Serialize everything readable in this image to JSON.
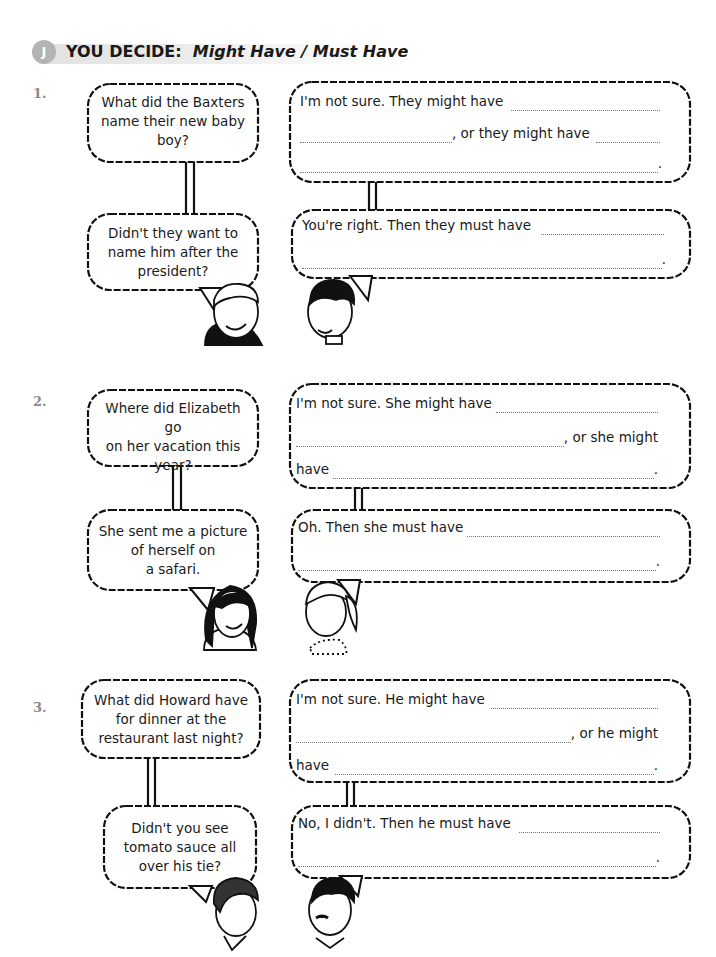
{
  "header": {
    "badge": "J",
    "title_prefix": "YOU DECIDE:",
    "title_italic": "Might Have / Must Have"
  },
  "exercises": [
    {
      "number": "1.",
      "question": "What did the Baxters name their new baby boy?",
      "q_lines": [
        "What did the Baxters",
        "name their new baby",
        "boy?"
      ],
      "followup_lines": [
        "Didn't they want to",
        "name him after the",
        "president?"
      ],
      "answer1": {
        "line1_prefix": "I'm not sure.  They might have",
        "line2_suffix": ", or they might have",
        "line3_suffix": "."
      },
      "answer2": {
        "line1_prefix": "You're right.  Then they must have",
        "line2_suffix": "."
      }
    },
    {
      "number": "2.",
      "q_lines": [
        "Where did Elizabeth go",
        "on her vacation this",
        "year?"
      ],
      "followup_lines": [
        "She sent me a picture",
        "of herself on",
        "a safari."
      ],
      "answer1": {
        "line1_prefix": "I'm not sure.  She might have",
        "line2_suffix": ", or she might",
        "line3_prefix": "have",
        "line3_suffix": "."
      },
      "answer2": {
        "line1_prefix": "Oh.  Then she must have",
        "line2_suffix": "."
      }
    },
    {
      "number": "3.",
      "q_lines": [
        "What did Howard have",
        "for dinner at the",
        "restaurant last night?"
      ],
      "followup_lines": [
        "Didn't you see",
        "tomato sauce all",
        "over his tie?"
      ],
      "answer1": {
        "line1_prefix": "I'm not sure.  He might have",
        "line2_suffix": ", or he might",
        "line3_prefix": "have",
        "line3_suffix": "."
      },
      "answer2": {
        "line1_prefix": "No, I didn't.  Then he must have",
        "line2_suffix": "."
      }
    }
  ]
}
